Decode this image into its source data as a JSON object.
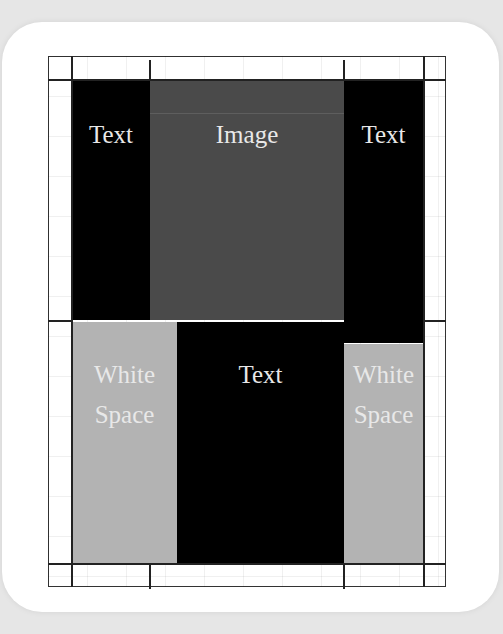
{
  "diagram": {
    "title": "",
    "colors": {
      "background": "#e6e6e6",
      "card": "#ffffff",
      "text_block": "#000000",
      "image_block": "#4a4a4a",
      "white_space_block": "#b3b3b3",
      "label": "#e8e8e8",
      "grid_line": "#222222"
    },
    "blocks": [
      {
        "id": "text-left",
        "type": "text",
        "label": "Text"
      },
      {
        "id": "image",
        "type": "image",
        "label": "Image"
      },
      {
        "id": "text-right",
        "type": "text",
        "label": "Text"
      },
      {
        "id": "white-space-left",
        "type": "white-space",
        "label_line1": "White",
        "label_line2": "Space"
      },
      {
        "id": "text-center",
        "type": "text",
        "label": "Text"
      },
      {
        "id": "white-space-right",
        "type": "white-space",
        "label_line1": "White",
        "label_line2": "Space"
      }
    ]
  }
}
